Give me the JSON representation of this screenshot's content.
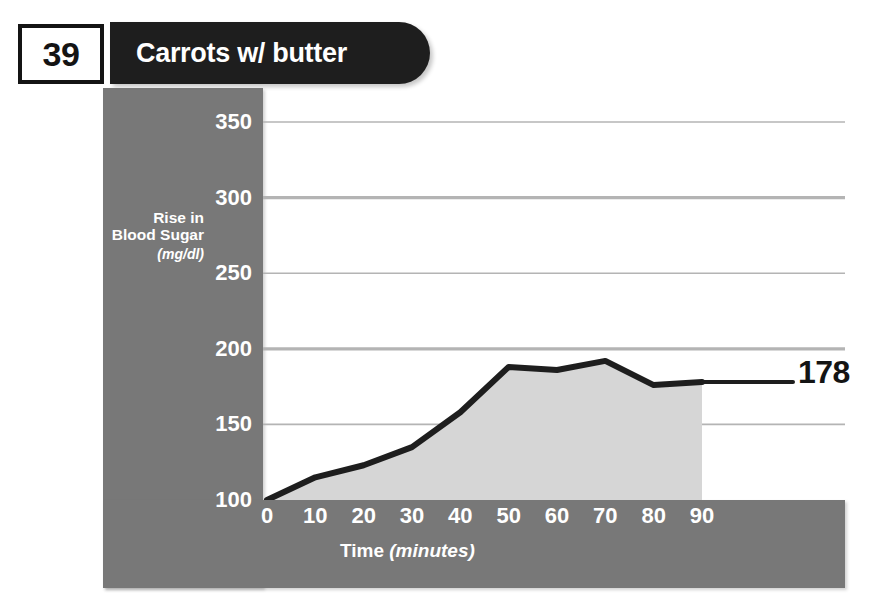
{
  "header": {
    "number": "39",
    "title": "Carrots w/ butter"
  },
  "colors": {
    "banner_bg": "#1e1e1e",
    "axis_band": "#787878",
    "area_fill": "#d6d6d6",
    "line": "#1e1e1e",
    "gridline": "#b4b4b4",
    "text_light": "#ffffff",
    "text_dark": "#141414"
  },
  "annotations": {
    "final_value": "178"
  },
  "chart_data": {
    "type": "area",
    "title": "Carrots w/ butter",
    "xlabel": "Time",
    "xlabel_units": "(minutes)",
    "ylabel": "Rise in Blood Sugar",
    "ylabel_units": "(mg/dl)",
    "x": [
      0,
      10,
      20,
      30,
      40,
      50,
      60,
      70,
      80,
      90
    ],
    "values": [
      100,
      115,
      123,
      135,
      158,
      188,
      186,
      192,
      176,
      178
    ],
    "xticks": [
      "0",
      "10",
      "20",
      "30",
      "40",
      "50",
      "60",
      "70",
      "80",
      "90"
    ],
    "yticks": [
      "100",
      "150",
      "200",
      "250",
      "300",
      "350"
    ],
    "xlim": [
      0,
      90
    ],
    "ylim": [
      100,
      350
    ],
    "grid": true,
    "legend": "none",
    "series": [
      {
        "name": "Rise in Blood Sugar",
        "values": [
          100,
          115,
          123,
          135,
          158,
          188,
          186,
          192,
          176,
          178
        ]
      }
    ]
  }
}
